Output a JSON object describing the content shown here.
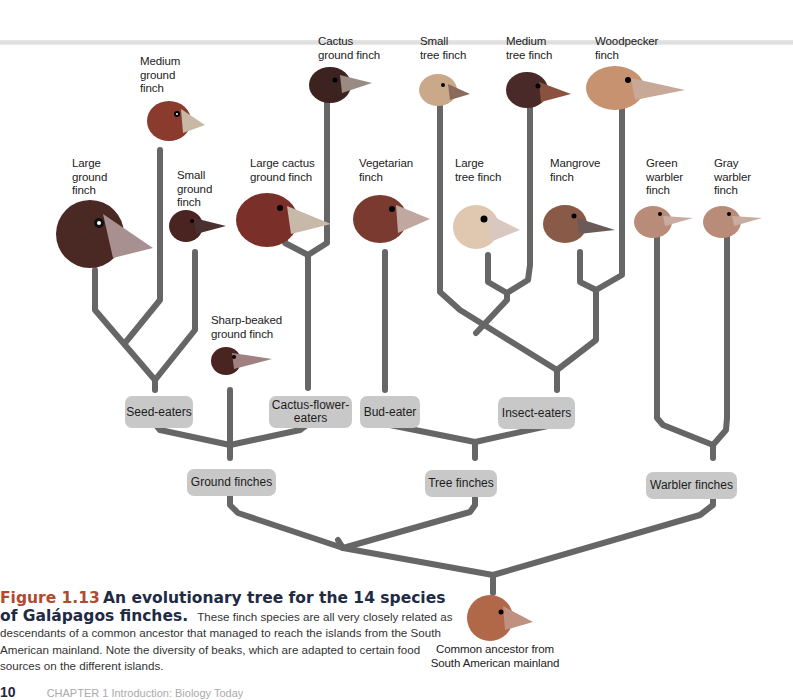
{
  "figure": {
    "number": "Figure 1.13",
    "title": "An evolutionary tree for the 14 species of Galápagos finches.",
    "body": "These finch species are all very closely related as descendants of a common ancestor that managed to reach the islands from the South American mainland. Note the diversity of beaks, which are adapted to certain food sources on the different islands."
  },
  "species": [
    {
      "id": "medium-ground-finch",
      "label": "Medium\nground\nfinch",
      "color": "#8a3b2e",
      "beak": "#c8b8a6"
    },
    {
      "id": "cactus-ground-finch",
      "label": "Cactus\nground finch",
      "color": "#3c2320",
      "beak": "#9a8a84"
    },
    {
      "id": "small-tree-finch",
      "label": "Small\ntree finch",
      "color": "#c9a98a",
      "beak": "#8a6a5a"
    },
    {
      "id": "medium-tree-finch",
      "label": "Medium\ntree finch",
      "color": "#4a2a28",
      "beak": "#8a5040"
    },
    {
      "id": "woodpecker-finch",
      "label": "Woodpecker\nfinch",
      "color": "#c79270",
      "beak": "#c8a896"
    },
    {
      "id": "large-ground-finch",
      "label": "Large\nground\nfinch",
      "color": "#4a2824",
      "beak": "#a89090"
    },
    {
      "id": "small-ground-finch",
      "label": "Small\nground\nfinch",
      "color": "#4a2420",
      "beak": "#4a3030"
    },
    {
      "id": "large-cactus-ground-finch",
      "label": "Large cactus\nground finch",
      "color": "#7a3028",
      "beak": "#c8b8a8"
    },
    {
      "id": "vegetarian-finch",
      "label": "Vegetarian\nfinch",
      "color": "#7a3a30",
      "beak": "#c0a8a0"
    },
    {
      "id": "large-tree-finch",
      "label": "Large\ntree finch",
      "color": "#e0c8b0",
      "beak": "#d8c8c0"
    },
    {
      "id": "mangrove-finch",
      "label": "Mangrove\nfinch",
      "color": "#8a5a48",
      "beak": "#6a5a58"
    },
    {
      "id": "green-warbler-finch",
      "label": "Green\nwarbler\nfinch",
      "color": "#b88c78",
      "beak": "#c8aca0"
    },
    {
      "id": "gray-warbler-finch",
      "label": "Gray\nwarbler\nfinch",
      "color": "#b88c78",
      "beak": "#c8aca0"
    },
    {
      "id": "sharp-beaked-ground-finch",
      "label": "Sharp-beaked\nground finch",
      "color": "#4a2420",
      "beak": "#a08080"
    }
  ],
  "groups": {
    "seed_eaters": "Seed-eaters",
    "cactus_flower_eaters": "Cactus-flower-\neaters",
    "bud_eater": "Bud-eater",
    "insect_eaters": "Insect-eaters",
    "ground_finches": "Ground finches",
    "tree_finches": "Tree finches",
    "warbler_finches": "Warbler finches"
  },
  "ancestor": {
    "label": "Common ancestor from\nSouth American mainland",
    "color": "#b06848",
    "beak": "#c09080"
  },
  "footer": {
    "page": "10",
    "chapter": "CHAPTER 1   Introduction: Biology Today"
  },
  "colors": {
    "branch": "#666666",
    "box": "#c8c8c8",
    "figure_number": "#b34a2e",
    "figure_title": "#1f2a44"
  }
}
